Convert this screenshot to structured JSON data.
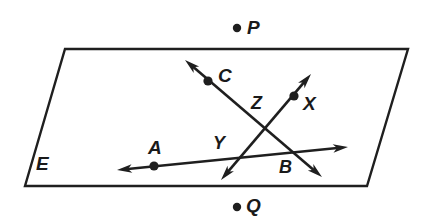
{
  "figure": {
    "width": 430,
    "height": 224,
    "background_color": "#ffffff",
    "stroke_color": "#1f1f1f",
    "label_color": "#1a1a1a"
  },
  "plane": {
    "name": "E",
    "label": "E",
    "label_x": 36,
    "label_y": 154,
    "outline_color": "#1f1f1f",
    "fill_color": "#ffffff",
    "stroke_width": 2.4,
    "vertices": [
      {
        "x": 65,
        "y": 49
      },
      {
        "x": 408,
        "y": 49
      },
      {
        "x": 367,
        "y": 186
      },
      {
        "x": 25,
        "y": 186
      }
    ]
  },
  "points": [
    {
      "id": "P",
      "label": "P",
      "dot_x": 237,
      "dot_y": 28,
      "label_x": 247,
      "label_y": 18,
      "in_plane": false,
      "radius": 4.2
    },
    {
      "id": "C",
      "label": "C",
      "dot_x": 208,
      "dot_y": 81,
      "label_x": 218,
      "label_y": 66,
      "in_plane": true,
      "radius": 4.6
    },
    {
      "id": "X",
      "label": "X",
      "dot_x": 294,
      "dot_y": 96,
      "label_x": 303,
      "label_y": 94,
      "in_plane": true,
      "radius": 4.6
    },
    {
      "id": "A",
      "label": "A",
      "dot_x": 154,
      "dot_y": 166,
      "label_x": 148,
      "label_y": 138,
      "in_plane": true,
      "radius": 4.6
    },
    {
      "id": "Q",
      "label": "Q",
      "dot_x": 237,
      "dot_y": 207,
      "label_x": 246,
      "label_y": 196,
      "in_plane": false,
      "radius": 4.2
    }
  ],
  "unmarked_labels": [
    {
      "id": "Z",
      "label": "Z",
      "label_x": 251,
      "label_y": 94
    },
    {
      "id": "Y",
      "label": "Y",
      "label_x": 213,
      "label_y": 134
    },
    {
      "id": "B",
      "label": "B",
      "label_x": 279,
      "label_y": 158
    }
  ],
  "lines": [
    {
      "id": "line-CB",
      "name": "line-through-C-and-B",
      "from": {
        "x": 185,
        "y": 60
      },
      "to": {
        "x": 322,
        "y": 177
      },
      "arrow_start": true,
      "arrow_end": true,
      "stroke_width": 2.6,
      "passes_through": [
        "C",
        "Z",
        "B"
      ]
    },
    {
      "id": "line-XY",
      "name": "line-through-X-and-Y",
      "from": {
        "x": 311,
        "y": 74
      },
      "to": {
        "x": 221,
        "y": 180
      },
      "arrow_start": true,
      "arrow_end": true,
      "stroke_width": 2.6,
      "passes_through": [
        "X",
        "Z",
        "Y"
      ]
    },
    {
      "id": "line-AB",
      "name": "line-through-A-and-B",
      "from": {
        "x": 117,
        "y": 170
      },
      "to": {
        "x": 348,
        "y": 147
      },
      "arrow_start": true,
      "arrow_end": true,
      "stroke_width": 2.6,
      "passes_through": [
        "A",
        "Y",
        "B"
      ]
    }
  ],
  "arrowhead": {
    "length": 15,
    "half_width": 4.2,
    "notch": 4
  }
}
